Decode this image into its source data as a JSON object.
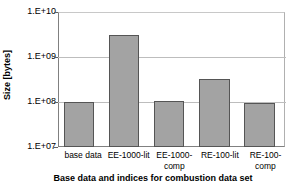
{
  "chart_data": {
    "type": "bar",
    "title": "",
    "xlabel": "Base data and indices for combustion data set",
    "ylabel": "Size [bytes]",
    "categories": [
      "base data",
      "EE-1000-lit",
      "EE-1000-comp",
      "RE-100-lit",
      "RE-100-comp"
    ],
    "category_lines": [
      [
        "base data"
      ],
      [
        "EE-1000-lit"
      ],
      [
        "EE-1000-",
        "comp"
      ],
      [
        "RE-100-lit"
      ],
      [
        "RE-100-",
        "comp"
      ]
    ],
    "values": [
      100000000.0,
      3300000000.0,
      105000000.0,
      330000000.0,
      95000000.0
    ],
    "yscale": "log",
    "ylim": [
      10000000.0,
      10000000000.0
    ],
    "ytick_values": [
      10000000000.0,
      1000000000.0,
      100000000.0,
      10000000.0
    ],
    "ytick_labels": [
      "1.E+10",
      "1.E+09",
      "1.E+08",
      "1.E+07"
    ],
    "grid": "horizontal",
    "legend": "none",
    "series": [
      {
        "name": "Size",
        "color": "#a3a3a3",
        "edge_color": "#555555",
        "values": [
          100000000.0,
          3300000000.0,
          105000000.0,
          330000000.0,
          95000000.0
        ]
      }
    ]
  }
}
